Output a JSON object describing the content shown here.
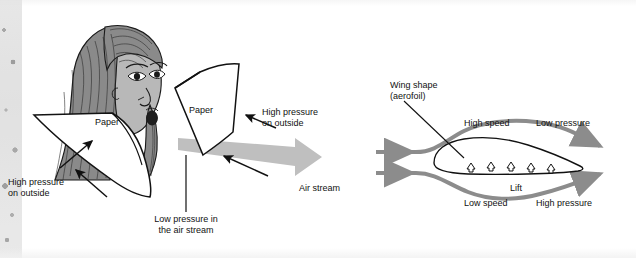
{
  "figure": {
    "background_color": "#ffffff",
    "ink_color": "#111111",
    "airstream_color": "#b3b3b3",
    "streamline_color": "#8c8c8c",
    "hair_color": "#7a7a7a",
    "skin_color": "#b0b0b0"
  },
  "left_panel": {
    "name": "paper-demonstration",
    "labels": {
      "paper_left": "Paper",
      "paper_right": "Paper",
      "high_pressure_outside_left_line1": "High pressure",
      "high_pressure_outside_left_line2": "on outside",
      "high_pressure_outside_right_line1": "High pressure",
      "high_pressure_outside_right_line2": "on outside",
      "low_pressure_line1": "Low pressure in",
      "low_pressure_line2": "the air stream",
      "air_stream": "Air stream"
    }
  },
  "right_panel": {
    "name": "aerofoil-diagram",
    "labels": {
      "wing_shape_line1": "Wing shape",
      "wing_shape_line2": "(aerofoil)",
      "high_speed": "High speed",
      "low_pressure": "Low pressure",
      "low_speed": "Low speed",
      "high_pressure": "High pressure",
      "lift": "Lift"
    },
    "lift_arrow_count": 5
  }
}
